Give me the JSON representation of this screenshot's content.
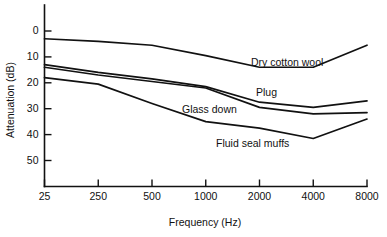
{
  "chart_data": {
    "type": "line",
    "title": "",
    "xlabel": "Frequency (Hz)",
    "ylabel": "Attenuation (dB)",
    "x_tick_labels": [
      "25",
      "250",
      "500",
      "1000",
      "2000",
      "4000",
      "8000"
    ],
    "x_values": [
      25,
      250,
      500,
      1000,
      2000,
      4000,
      8000
    ],
    "x_scale": "categorical-octave",
    "y_tick_labels": [
      "0",
      "10",
      "20",
      "30",
      "40",
      "50"
    ],
    "y_ticks": [
      0,
      10,
      20,
      30,
      40,
      50
    ],
    "ylim": [
      0,
      56
    ],
    "y_inverted": true,
    "grid": false,
    "legend": "inline-annotations",
    "series": [
      {
        "name": "Dry cotton wool",
        "label": "Dry cotton wool",
        "values": [
          3,
          4,
          5.5,
          9.5,
          14,
          14,
          5.5
        ]
      },
      {
        "name": "Plug",
        "label": "Plug",
        "values": [
          13,
          16,
          18.5,
          21.5,
          27.5,
          29.5,
          27
        ]
      },
      {
        "name": "Glass down",
        "label": "Glass down",
        "values": [
          14,
          17,
          19.5,
          22,
          29.5,
          32,
          31.5
        ]
      },
      {
        "name": "Fluid seal muffs",
        "label": "Fluid seal muffs",
        "values": [
          18,
          20.5,
          28,
          35,
          37.5,
          41.5,
          34
        ]
      }
    ]
  },
  "annotations": [
    {
      "text": "Dry cotton wool",
      "x": 251,
      "y": 66
    },
    {
      "text": "Plug",
      "x": 256,
      "y": 96
    },
    {
      "text": "Glass down",
      "x": 182,
      "y": 113
    },
    {
      "text": "Fluid seal muffs",
      "x": 216,
      "y": 147
    }
  ],
  "colors": {
    "line": "#111111",
    "axis": "#111111",
    "background": "#ffffff"
  }
}
